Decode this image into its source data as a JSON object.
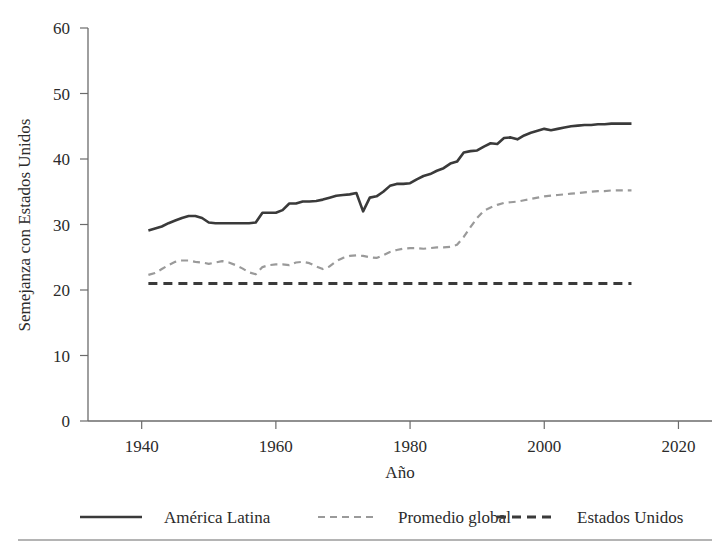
{
  "chart_data": {
    "type": "line",
    "title": "",
    "xlabel": "Año",
    "ylabel": "Semejanza con Estados Unidos",
    "xlim": [
      1932,
      2025
    ],
    "ylim": [
      0,
      60
    ],
    "xticks": [
      1940,
      1960,
      1980,
      2000,
      2020
    ],
    "xtick_labels": [
      "1940",
      "1960",
      "1980",
      "2000",
      "2020"
    ],
    "yticks": [
      0,
      10,
      20,
      30,
      40,
      50,
      60
    ],
    "ytick_labels": [
      "0",
      "10",
      "20",
      "30",
      "40",
      "50",
      "60"
    ],
    "grid": false,
    "legend_position": "bottom",
    "x": [
      1941,
      1942,
      1943,
      1944,
      1945,
      1946,
      1947,
      1948,
      1949,
      1950,
      1951,
      1952,
      1953,
      1954,
      1955,
      1956,
      1957,
      1958,
      1959,
      1960,
      1961,
      1962,
      1963,
      1964,
      1965,
      1966,
      1967,
      1968,
      1969,
      1970,
      1971,
      1972,
      1973,
      1974,
      1975,
      1976,
      1977,
      1978,
      1979,
      1980,
      1981,
      1982,
      1983,
      1984,
      1985,
      1986,
      1987,
      1988,
      1989,
      1990,
      1991,
      1992,
      1993,
      1994,
      1995,
      1996,
      1997,
      1998,
      1999,
      2000,
      2001,
      2002,
      2003,
      2004,
      2005,
      2006,
      2007,
      2008,
      2009,
      2010,
      2011,
      2012,
      2013
    ],
    "series": [
      {
        "name": "América Latina",
        "style": "solid",
        "color": "#3a3a3a",
        "values": [
          29.1,
          29.4,
          29.7,
          30.2,
          30.6,
          31.0,
          31.3,
          31.3,
          31.0,
          30.3,
          30.2,
          30.2,
          30.2,
          30.2,
          30.2,
          30.2,
          30.3,
          31.8,
          31.8,
          31.8,
          32.2,
          33.2,
          33.2,
          33.5,
          33.5,
          33.6,
          33.8,
          34.1,
          34.4,
          34.5,
          34.6,
          34.8,
          32.0,
          34.1,
          34.3,
          35.0,
          35.9,
          36.2,
          36.2,
          36.3,
          36.9,
          37.4,
          37.7,
          38.2,
          38.6,
          39.3,
          39.6,
          41.0,
          41.2,
          41.3,
          41.9,
          42.4,
          42.3,
          43.2,
          43.3,
          43.0,
          43.6,
          44.0,
          44.3,
          44.6,
          44.4,
          44.6,
          44.8,
          45.0,
          45.1,
          45.2,
          45.2,
          45.3,
          45.3,
          45.4,
          45.4,
          45.4,
          45.4
        ]
      },
      {
        "name": "Promedio global",
        "style": "dashed",
        "color": "#9a9a9a",
        "values": [
          22.3,
          22.6,
          23.2,
          23.8,
          24.3,
          24.5,
          24.5,
          24.3,
          24.2,
          24.0,
          24.2,
          24.4,
          24.2,
          23.8,
          23.3,
          22.7,
          22.4,
          23.5,
          23.8,
          23.9,
          23.9,
          23.8,
          24.2,
          24.3,
          24.1,
          23.6,
          23.2,
          23.6,
          24.4,
          24.9,
          25.2,
          25.3,
          25.2,
          25.0,
          24.9,
          25.3,
          25.8,
          26.1,
          26.3,
          26.4,
          26.4,
          26.3,
          26.4,
          26.5,
          26.5,
          26.6,
          26.9,
          28.1,
          29.6,
          31.0,
          32.1,
          32.6,
          33.0,
          33.3,
          33.4,
          33.5,
          33.7,
          33.9,
          34.1,
          34.3,
          34.4,
          34.5,
          34.6,
          34.7,
          34.8,
          34.9,
          35.0,
          35.1,
          35.1,
          35.2,
          35.2,
          35.2,
          35.2
        ]
      },
      {
        "name": "Estados Unidos",
        "style": "dashed-heavy",
        "color": "#3a3a3a",
        "values": [
          21.0,
          21.0,
          21.0,
          21.0,
          21.0,
          21.0,
          21.0,
          21.0,
          21.0,
          21.0,
          21.0,
          21.0,
          21.0,
          21.0,
          21.0,
          21.0,
          21.0,
          21.0,
          21.0,
          21.0,
          21.0,
          21.0,
          21.0,
          21.0,
          21.0,
          21.0,
          21.0,
          21.0,
          21.0,
          21.0,
          21.0,
          21.0,
          21.0,
          21.0,
          21.0,
          21.0,
          21.0,
          21.0,
          21.0,
          21.0,
          21.0,
          21.0,
          21.0,
          21.0,
          21.0,
          21.0,
          21.0,
          21.0,
          21.0,
          21.0,
          21.0,
          21.0,
          21.0,
          21.0,
          21.0,
          21.0,
          21.0,
          21.0,
          21.0,
          21.0,
          21.0,
          21.0,
          21.0,
          21.0,
          21.0,
          21.0,
          21.0,
          21.0,
          21.0,
          21.0,
          21.0,
          21.0,
          21.0
        ]
      }
    ]
  },
  "legend": {
    "items": [
      {
        "label": "América Latina"
      },
      {
        "label": "Promedio global"
      },
      {
        "label": "Estados Unidos"
      }
    ]
  },
  "axes": {
    "y_title": "Semejanza con Estados Unidos",
    "x_title": "Año"
  },
  "colors": {
    "line_primary": "#3a3a3a",
    "line_secondary": "#9a9a9a",
    "axis": "#6b6b6b",
    "text": "#2b2b2b",
    "background": "#ffffff"
  }
}
